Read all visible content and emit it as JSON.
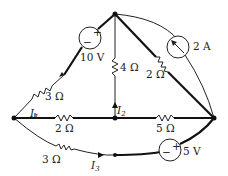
{
  "diagram": {
    "type": "electrical-circuit",
    "nodes": [
      "top",
      "left",
      "middle",
      "right"
    ],
    "components": [
      {
        "id": "v10",
        "type": "voltage-source",
        "label": "10 V",
        "polarity_plus": "+",
        "polarity_minus": "−",
        "branch": "left-to-top"
      },
      {
        "id": "r3a",
        "type": "resistor",
        "label": "3 Ω",
        "branch": "left-to-top"
      },
      {
        "id": "r4",
        "type": "resistor",
        "label": "4 Ω",
        "branch": "top-to-middle"
      },
      {
        "id": "r2a",
        "type": "resistor",
        "label": "2 Ω",
        "branch": "top-to-right"
      },
      {
        "id": "i2a",
        "type": "current-source",
        "label": "2 A",
        "branch": "top-to-right-arc"
      },
      {
        "id": "r2b",
        "type": "resistor",
        "label": "2 Ω",
        "branch": "left-to-middle"
      },
      {
        "id": "r5",
        "type": "resistor",
        "label": "5 Ω",
        "branch": "middle-to-right"
      },
      {
        "id": "r3b",
        "type": "resistor",
        "label": "3 Ω",
        "branch": "left-to-right-bottom"
      },
      {
        "id": "v5",
        "type": "voltage-source",
        "label": "5 V",
        "polarity_plus": "+",
        "polarity_minus": "−",
        "branch": "left-to-right-bottom"
      }
    ],
    "currents": [
      {
        "id": "I1",
        "symbol": "I",
        "subscript": "1"
      },
      {
        "id": "I2",
        "symbol": "I",
        "subscript": "2"
      },
      {
        "id": "I3",
        "symbol": "I",
        "subscript": "3"
      }
    ],
    "colors": {
      "wire": "#111111",
      "background": "#ffffff"
    }
  }
}
